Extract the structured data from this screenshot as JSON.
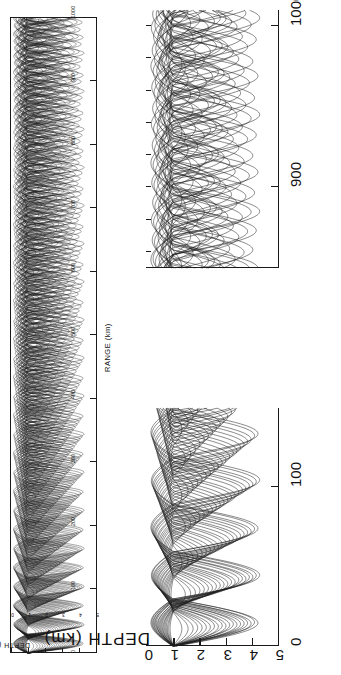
{
  "figure": {
    "orientation": "rotated-90-ccw",
    "background_color": "#ffffff",
    "ink_color": "#1a1a1a"
  },
  "panels": [
    {
      "id": "overview",
      "name": "full-range-ray-trace",
      "x_axis": {
        "label": "RANGE  (km)",
        "ticks": [
          0,
          100,
          200,
          300,
          400,
          500,
          600,
          700,
          800,
          900,
          1000
        ],
        "tick_labels": [
          "0",
          "100",
          "200",
          "300",
          "400",
          "500",
          "600",
          "700",
          "800",
          "900",
          "1000"
        ],
        "min": 0,
        "max": 1000,
        "units": "km"
      },
      "y_axis": {
        "label": "DEPTH  (km)",
        "ticks": [
          0,
          1,
          2,
          3,
          4,
          5
        ],
        "tick_labels": [
          "0",
          "1",
          "2",
          "3",
          "4",
          "5"
        ],
        "min": 0,
        "max": 5,
        "units": "km",
        "direction": "increasing-downward"
      }
    },
    {
      "id": "detail-near",
      "name": "near-range-detail-ray-trace",
      "x_axis": {
        "label": "",
        "ticks": [
          0,
          100
        ],
        "tick_labels": [
          "0",
          "100"
        ],
        "min": 0,
        "max": 150,
        "units": "km"
      },
      "y_axis": {
        "label": "DEPTH  (km)",
        "ticks": [
          0,
          1,
          2,
          3,
          4,
          5
        ],
        "tick_labels": [
          "0",
          "1",
          "2",
          "3",
          "4",
          "5"
        ],
        "min": 0,
        "max": 5,
        "units": "km",
        "direction": "increasing-downward"
      }
    },
    {
      "id": "detail-far",
      "name": "far-range-detail-ray-trace",
      "x_axis": {
        "label": "",
        "ticks": [
          900,
          1000
        ],
        "tick_labels": [
          "900",
          "1000"
        ],
        "min": 850,
        "max": 1010,
        "units": "km"
      },
      "y_axis": {
        "label": "",
        "ticks": [
          0,
          1,
          2,
          3,
          4,
          5
        ],
        "tick_labels": [
          "",
          "",
          "",
          "",
          "",
          ""
        ],
        "min": 0,
        "max": 5,
        "units": "km",
        "direction": "increasing-downward"
      }
    }
  ],
  "chart_data": {
    "type": "line",
    "title": "",
    "xlabel": "RANGE  (km)",
    "ylabel": "DEPTH  (km)",
    "xlim": [
      0,
      1000
    ],
    "ylim": [
      0,
      5
    ],
    "grid": false,
    "legend": "none",
    "source": {
      "range_km": 0,
      "depth_km": 1.0
    },
    "channel_axis_depth_km": 1.0,
    "ray_fan": {
      "count": 41,
      "launch_angle_min_deg": -12,
      "launch_angle_max_deg": 12,
      "cycle_distance_km": 50,
      "upper_turning_depth_km": 0.15,
      "lower_turning_depth_km": 4.3
    },
    "series": [
      {
        "name": "ray-bundle-overview",
        "panel": "overview",
        "x": [
          0,
          100,
          200,
          300,
          400,
          500,
          600,
          700,
          800,
          900,
          1000
        ],
        "envelope_upper_km": [
          1.0,
          0.2,
          0.15,
          0.15,
          0.15,
          0.15,
          0.15,
          0.15,
          0.15,
          0.2,
          0.6
        ],
        "envelope_lower_km": [
          1.0,
          4.2,
          4.4,
          4.4,
          4.4,
          4.4,
          4.4,
          4.4,
          4.4,
          4.2,
          2.0
        ]
      },
      {
        "name": "ray-bundle-near-detail",
        "panel": "detail-near",
        "x": [
          0,
          25,
          50,
          75,
          100,
          125,
          150
        ],
        "envelope_upper_km": [
          1.0,
          0.3,
          0.2,
          0.18,
          0.16,
          0.15,
          0.15
        ],
        "envelope_lower_km": [
          1.0,
          3.6,
          4.1,
          4.3,
          4.4,
          4.4,
          4.4
        ]
      },
      {
        "name": "ray-bundle-far-detail",
        "panel": "detail-far",
        "x": [
          850,
          875,
          900,
          925,
          950,
          975,
          1000
        ],
        "envelope_upper_km": [
          0.15,
          0.15,
          0.16,
          0.2,
          0.3,
          0.5,
          0.9
        ],
        "envelope_lower_km": [
          4.4,
          4.4,
          4.35,
          4.2,
          3.8,
          3.0,
          1.6
        ]
      }
    ]
  }
}
